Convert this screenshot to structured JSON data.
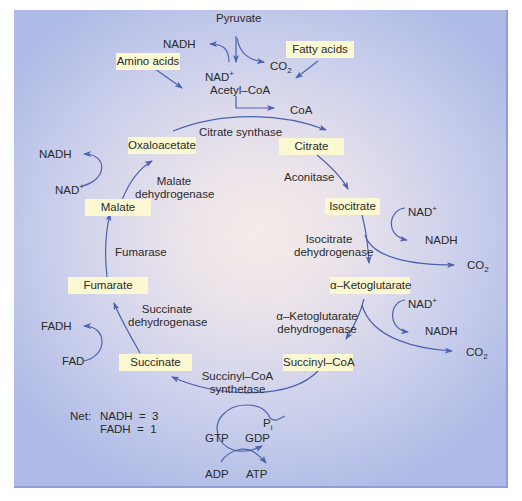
{
  "diagram": {
    "colors": {
      "arrow": "#4a62b0",
      "label_box": "#fbf8d2",
      "background_center": "#f5ece8",
      "background_edge": "#aebbe6",
      "text": "#2a2a2a"
    },
    "inputs": {
      "pyruvate": "Pyruvate",
      "amino_acids": "Amino acids",
      "fatty_acids": "Fatty acids",
      "acetyl_coa": "Acetyl–CoA",
      "coa": "CoA",
      "pyruvate_nadh": "NADH",
      "pyruvate_nad": "NAD",
      "pyruvate_co2": "CO",
      "sub2": "2",
      "plus": "+"
    },
    "metabolites": [
      {
        "id": "oxaloacetate",
        "label": "Oxaloacetate"
      },
      {
        "id": "citrate",
        "label": "Citrate"
      },
      {
        "id": "isocitrate",
        "label": "Isocitrate"
      },
      {
        "id": "alpha_ketoglutarate",
        "label": "α–Ketoglutarate"
      },
      {
        "id": "succinyl_coa",
        "label": "Succinyl–CoA"
      },
      {
        "id": "succinate",
        "label": "Succinate"
      },
      {
        "id": "fumarate",
        "label": "Fumarate"
      },
      {
        "id": "malate",
        "label": "Malate"
      }
    ],
    "enzymes": {
      "citrate_synthase": "Citrate synthase",
      "aconitase": "Aconitase",
      "isocitrate_dh_1": "Isocitrate",
      "isocitrate_dh_2": "dehydrogenase",
      "akg_dh_1": "α–Ketoglutarate",
      "akg_dh_2": "dehydrogenase",
      "succinyl_coa_synthetase_1": "Succinyl–CoA",
      "succinyl_coa_synthetase_2": "synthetase",
      "succinate_dh_1": "Succinate",
      "succinate_dh_2": "dehydrogenase",
      "fumarase": "Fumarase",
      "malate_dh_1": "Malate",
      "malate_dh_2": "dehydrogenase"
    },
    "cofactors": {
      "isocitrate_nad": "NAD",
      "isocitrate_nadh": "NADH",
      "isocitrate_co2": "CO",
      "akg_nad": "NAD",
      "akg_nadh": "NADH",
      "akg_co2": "CO",
      "succinate_fad": "FAD",
      "succinate_fadh": "FADH",
      "malate_nad": "NAD",
      "malate_nadh": "NADH",
      "gtp": "GTP",
      "gdp": "GDP",
      "pi": "P",
      "pi_sub": "i",
      "adp": "ADP",
      "atp": "ATP"
    },
    "net": {
      "label": "Net:",
      "row1": "NADH  =  3",
      "row2": "FADH  =  1"
    }
  }
}
